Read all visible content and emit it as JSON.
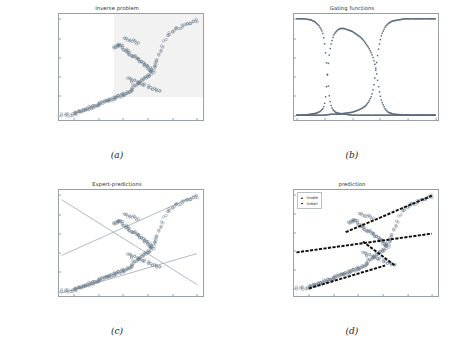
{
  "figure": {
    "panels": [
      {
        "key": "a",
        "caption": "(a)",
        "title": "Inverse problem",
        "legend": null
      },
      {
        "key": "b",
        "caption": "(b)",
        "title": "Gating functions",
        "legend": null
      },
      {
        "key": "c",
        "caption": "(c)",
        "title": "Expert-predictions",
        "legend": null
      },
      {
        "key": "d",
        "caption": "(d)",
        "title": "prediction",
        "legend": {
          "items": [
            "mode",
            "mean"
          ]
        }
      }
    ],
    "colors": {
      "scatter_marker": "#6b7b8c",
      "gating_marker": "#5a6a7a",
      "expert_line": "#7a8a99",
      "prediction_line": "#101010",
      "axis": "#9aa0a8",
      "shade": "#e8e8e8",
      "text": "#2b2b2b"
    }
  },
  "chart_data": [
    {
      "type": "scatter",
      "panel": "a",
      "title": "Inverse problem",
      "xlabel": "",
      "ylabel": "",
      "xlim": [
        -0.12,
        1.05
      ],
      "ylim": [
        -0.05,
        1.05
      ],
      "xticks": [
        "0.0",
        "0.2",
        "0.4",
        "0.6",
        "0.8",
        "1.0"
      ],
      "yticks": [
        "0.0",
        "0.2",
        "0.4",
        "0.6",
        "0.8",
        "1.0"
      ],
      "xtick_values": [
        0.0,
        0.2,
        0.4,
        0.6,
        0.8,
        1.0
      ],
      "ytick_values": [
        0.0,
        0.2,
        0.4,
        0.6,
        0.8,
        1.0
      ],
      "grid": false,
      "legend_position": "none",
      "marker": "open-circle",
      "annotations": [
        "faint grey shaded band over upper-right region"
      ],
      "x": [
        -0.1,
        -0.07,
        -0.04,
        -0.02,
        0.0,
        0.01,
        0.02,
        0.03,
        0.04,
        0.05,
        0.06,
        0.07,
        0.08,
        0.09,
        0.1,
        0.11,
        0.12,
        0.13,
        0.14,
        0.15,
        0.16,
        0.17,
        0.18,
        0.19,
        0.2,
        0.21,
        0.22,
        0.23,
        0.24,
        0.25,
        0.26,
        0.27,
        0.28,
        0.29,
        0.3,
        0.31,
        0.32,
        0.33,
        0.34,
        0.35,
        0.36,
        0.37,
        0.38,
        0.39,
        0.4,
        0.41,
        0.42,
        0.43,
        0.44,
        0.45,
        0.46,
        0.47,
        0.48,
        0.49,
        0.5,
        0.51,
        0.52,
        0.53,
        0.54,
        0.55,
        0.56,
        0.57,
        0.58,
        0.59,
        0.6,
        0.61,
        0.62,
        0.63,
        0.64,
        0.65,
        0.66,
        0.67,
        0.68,
        0.69,
        0.7,
        0.72,
        0.74,
        0.76,
        0.78,
        0.8,
        0.82,
        0.84,
        0.86,
        0.88,
        0.9,
        0.92,
        0.94,
        0.96,
        0.98,
        1.0,
        0.33,
        0.34,
        0.35,
        0.36,
        0.37,
        0.38,
        0.39,
        0.4,
        0.41,
        0.42,
        0.43,
        0.44,
        0.45,
        0.46,
        0.47,
        0.48,
        0.49,
        0.5,
        0.51,
        0.52,
        0.53,
        0.54,
        0.55,
        0.56,
        0.57,
        0.58,
        0.59,
        0.6,
        0.61,
        0.62,
        0.63,
        0.64,
        0.65,
        0.44,
        0.46,
        0.48,
        0.5,
        0.52,
        0.54,
        0.56,
        0.58,
        0.6,
        0.62,
        0.64,
        0.66,
        0.68,
        0.7,
        0.42,
        0.44,
        0.46,
        0.48,
        0.5,
        0.52
      ],
      "y": [
        0.0,
        0.0,
        0.0,
        0.01,
        0.01,
        0.02,
        0.02,
        0.03,
        0.03,
        0.04,
        0.04,
        0.05,
        0.05,
        0.06,
        0.06,
        0.07,
        0.07,
        0.08,
        0.08,
        0.09,
        0.09,
        0.1,
        0.1,
        0.11,
        0.11,
        0.12,
        0.12,
        0.13,
        0.13,
        0.14,
        0.14,
        0.15,
        0.15,
        0.16,
        0.16,
        0.17,
        0.17,
        0.18,
        0.18,
        0.19,
        0.19,
        0.2,
        0.2,
        0.21,
        0.21,
        0.22,
        0.22,
        0.23,
        0.24,
        0.25,
        0.26,
        0.27,
        0.28,
        0.3,
        0.31,
        0.32,
        0.33,
        0.34,
        0.35,
        0.36,
        0.37,
        0.38,
        0.39,
        0.4,
        0.41,
        0.42,
        0.44,
        0.46,
        0.48,
        0.5,
        0.52,
        0.55,
        0.58,
        0.62,
        0.66,
        0.72,
        0.78,
        0.82,
        0.85,
        0.87,
        0.89,
        0.9,
        0.91,
        0.92,
        0.93,
        0.94,
        0.95,
        0.96,
        0.97,
        0.98,
        0.7,
        0.71,
        0.72,
        0.73,
        0.73,
        0.72,
        0.71,
        0.7,
        0.69,
        0.68,
        0.67,
        0.66,
        0.65,
        0.64,
        0.63,
        0.62,
        0.61,
        0.6,
        0.59,
        0.58,
        0.57,
        0.56,
        0.55,
        0.54,
        0.53,
        0.52,
        0.51,
        0.5,
        0.49,
        0.48,
        0.47,
        0.46,
        0.45,
        0.38,
        0.37,
        0.36,
        0.35,
        0.34,
        0.33,
        0.32,
        0.31,
        0.3,
        0.29,
        0.28,
        0.27,
        0.26,
        0.25,
        0.8,
        0.79,
        0.78,
        0.77,
        0.76,
        0.75
      ]
    },
    {
      "type": "scatter",
      "panel": "b",
      "title": "Gating functions",
      "xlabel": "",
      "ylabel": "",
      "xlim": [
        -0.02,
        1.02
      ],
      "ylim": [
        -0.05,
        1.05
      ],
      "xticks": [
        "0.0",
        "0.2",
        "0.4",
        "0.6",
        "0.8",
        "1.0"
      ],
      "yticks": [
        "0.0",
        "0.2",
        "0.4",
        "0.6",
        "0.8",
        "1.0"
      ],
      "xtick_values": [
        0.0,
        0.2,
        0.4,
        0.6,
        0.8,
        1.0
      ],
      "ytick_values": [
        0.0,
        0.2,
        0.4,
        0.6,
        0.8,
        1.0
      ],
      "grid": false,
      "legend_position": "none",
      "marker": "dot",
      "series": [
        {
          "name": "gate-1",
          "description": "decreasing sigmoid, drops from 1.0 to 0.0 near x=0.23",
          "x": [
            0.0,
            0.05,
            0.1,
            0.13,
            0.16,
            0.18,
            0.19,
            0.2,
            0.21,
            0.215,
            0.22,
            0.225,
            0.23,
            0.235,
            0.24,
            0.25,
            0.26,
            0.28,
            0.3,
            0.35,
            0.4,
            0.5,
            0.6,
            0.7,
            0.8,
            0.9,
            1.0
          ],
          "y": [
            1.0,
            1.0,
            0.99,
            0.97,
            0.93,
            0.88,
            0.84,
            0.76,
            0.62,
            0.54,
            0.45,
            0.36,
            0.27,
            0.2,
            0.15,
            0.09,
            0.06,
            0.03,
            0.02,
            0.01,
            0.0,
            0.0,
            0.0,
            0.0,
            0.0,
            0.0,
            0.0
          ]
        },
        {
          "name": "gate-2",
          "description": "bump peaking near 0.9 between x=0.30 and x=0.45",
          "x": [
            0.0,
            0.05,
            0.1,
            0.14,
            0.17,
            0.19,
            0.2,
            0.21,
            0.215,
            0.22,
            0.225,
            0.23,
            0.24,
            0.25,
            0.26,
            0.27,
            0.28,
            0.3,
            0.32,
            0.34,
            0.36,
            0.38,
            0.4,
            0.42,
            0.44,
            0.46,
            0.48,
            0.5,
            0.52,
            0.54,
            0.55,
            0.56,
            0.57,
            0.575,
            0.58,
            0.585,
            0.59,
            0.6,
            0.61,
            0.62,
            0.64,
            0.66,
            0.7,
            0.8,
            0.9,
            1.0
          ],
          "y": [
            0.0,
            0.0,
            0.01,
            0.02,
            0.04,
            0.07,
            0.11,
            0.21,
            0.3,
            0.39,
            0.48,
            0.57,
            0.68,
            0.75,
            0.8,
            0.84,
            0.86,
            0.89,
            0.9,
            0.9,
            0.89,
            0.88,
            0.87,
            0.85,
            0.83,
            0.81,
            0.78,
            0.74,
            0.7,
            0.64,
            0.6,
            0.55,
            0.49,
            0.45,
            0.4,
            0.35,
            0.3,
            0.22,
            0.16,
            0.12,
            0.06,
            0.03,
            0.01,
            0.0,
            0.0,
            0.0
          ]
        },
        {
          "name": "gate-3",
          "description": "increasing sigmoid, rises from 0.0 to 1.0 near x=0.58",
          "x": [
            0.0,
            0.1,
            0.2,
            0.25,
            0.3,
            0.35,
            0.4,
            0.44,
            0.47,
            0.5,
            0.52,
            0.54,
            0.55,
            0.56,
            0.565,
            0.57,
            0.575,
            0.58,
            0.585,
            0.59,
            0.6,
            0.61,
            0.62,
            0.64,
            0.66,
            0.68,
            0.7,
            0.74,
            0.78,
            0.82,
            0.86,
            0.9,
            0.95,
            1.0
          ],
          "y": [
            0.0,
            0.0,
            0.0,
            0.01,
            0.01,
            0.02,
            0.03,
            0.05,
            0.07,
            0.1,
            0.14,
            0.2,
            0.26,
            0.34,
            0.4,
            0.46,
            0.52,
            0.58,
            0.63,
            0.68,
            0.76,
            0.82,
            0.86,
            0.92,
            0.95,
            0.97,
            0.98,
            0.99,
            1.0,
            1.0,
            1.0,
            1.0,
            1.0,
            1.0
          ]
        }
      ]
    },
    {
      "type": "scatter",
      "panel": "c",
      "title": "Expert-predictions",
      "xlabel": "",
      "ylabel": "",
      "xlim": [
        -0.12,
        1.05
      ],
      "ylim": [
        -0.05,
        1.05
      ],
      "xticks": [
        "0.0",
        "0.2",
        "0.4",
        "0.6",
        "0.8",
        "1.0"
      ],
      "yticks": [
        "0.0",
        "0.2",
        "0.4",
        "0.6",
        "0.8",
        "1.0"
      ],
      "xtick_values": [
        0.0,
        0.2,
        0.4,
        0.6,
        0.8,
        1.0
      ],
      "ytick_values": [
        0.0,
        0.2,
        0.4,
        0.6,
        0.8,
        1.0
      ],
      "grid": false,
      "legend_position": "none",
      "marker": "open-circle",
      "overlay_lines": [
        {
          "name": "expert-1-descending",
          "x": [
            -0.1,
            1.0
          ],
          "y": [
            0.95,
            0.07
          ]
        },
        {
          "name": "expert-2-ascending-steep",
          "x": [
            -0.1,
            1.0
          ],
          "y": [
            0.37,
            1.0
          ]
        },
        {
          "name": "expert-3-ascending-shallow",
          "x": [
            -0.1,
            1.0
          ],
          "y": [
            -0.02,
            0.39
          ]
        }
      ]
    },
    {
      "type": "scatter",
      "panel": "d",
      "title": "prediction",
      "xlabel": "",
      "ylabel": "",
      "xlim": [
        -0.12,
        1.05
      ],
      "ylim": [
        -0.08,
        1.05
      ],
      "xticks": [
        "0.0",
        "0.2",
        "0.4",
        "0.6",
        "0.8",
        "1.0"
      ],
      "yticks": [
        "0.0",
        "0.2",
        "0.4",
        "0.6",
        "0.8",
        "1.0"
      ],
      "xtick_values": [
        0.0,
        0.2,
        0.4,
        0.6,
        0.8,
        1.0
      ],
      "ytick_values": [
        0.0,
        0.2,
        0.4,
        0.6,
        0.8,
        1.0
      ],
      "grid": false,
      "legend_position": "upper left",
      "legend_entries": [
        "mode",
        "mean"
      ],
      "marker": "open-circle",
      "overlay_lines": [
        {
          "name": "mean-shallow-ascending",
          "x": [
            -0.1,
            1.0
          ],
          "y": [
            0.385,
            0.585
          ]
        },
        {
          "name": "mode-upper-branch",
          "x": [
            0.3,
            1.0
          ],
          "y": [
            0.6,
            0.99
          ]
        },
        {
          "name": "mode-lower-branch",
          "x": [
            0.0,
            0.62
          ],
          "y": [
            0.0,
            0.245
          ]
        },
        {
          "name": "mode-transition-descending",
          "x": [
            0.44,
            0.7
          ],
          "y": [
            0.5,
            0.245
          ]
        }
      ]
    }
  ]
}
